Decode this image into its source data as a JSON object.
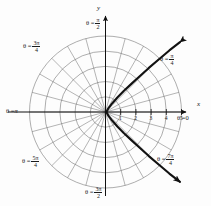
{
  "figure": {
    "type": "polar-plot",
    "axes": {
      "x_label": "x",
      "y_label": "y"
    },
    "theta_labels": [
      {
        "key": "theta_0",
        "text": "θ = 0",
        "prefix": "θ =",
        "num": "",
        "den": "",
        "plain": "0",
        "angle_deg": 0
      },
      {
        "key": "theta_pi4",
        "text": "θ = π/4",
        "prefix": "θ =",
        "num": "π",
        "den": "4",
        "plain": "",
        "angle_deg": 45
      },
      {
        "key": "theta_pi2",
        "text": "θ = π/2",
        "prefix": "θ =",
        "num": "π",
        "den": "2",
        "plain": "",
        "angle_deg": 90
      },
      {
        "key": "theta_3pi4",
        "text": "θ = 3π/4",
        "prefix": "θ =",
        "num": "3π",
        "den": "4",
        "plain": "",
        "angle_deg": 135
      },
      {
        "key": "theta_pi",
        "text": "θ = π",
        "prefix": "θ =",
        "num": "",
        "den": "",
        "plain": "π",
        "angle_deg": 180
      },
      {
        "key": "theta_5pi4",
        "text": "θ = 5π/4",
        "prefix": "θ =",
        "num": "5π",
        "den": "4",
        "plain": "",
        "angle_deg": 225
      },
      {
        "key": "theta_3pi2",
        "text": "θ = 3π/2",
        "prefix": "θ =",
        "num": "3π",
        "den": "2",
        "plain": "",
        "angle_deg": 270
      },
      {
        "key": "theta_7pi4",
        "text": "θ = 7π/4",
        "prefix": "θ =",
        "num": "7π",
        "den": "4",
        "plain": "",
        "angle_deg": 315
      }
    ],
    "x_ticks": [
      "1",
      "2",
      "3",
      "4",
      "5"
    ]
  },
  "chart_data": {
    "type": "line",
    "title": "",
    "xlabel": "x",
    "ylabel": "y",
    "coordinate_system": "polar",
    "grid": true,
    "grid_circles_r": [
      1,
      2,
      3,
      4,
      5
    ],
    "grid_radial_step_deg": 15,
    "rlim": [
      0,
      5
    ],
    "xlim": [
      -5,
      5
    ],
    "ylim": [
      -5,
      5
    ],
    "x_tick_labels": [
      "1",
      "2",
      "3",
      "4",
      "5"
    ],
    "theta_tick_labels": [
      "θ = 0",
      "θ = π/4",
      "θ = π/2",
      "θ = 3π/4",
      "θ = π",
      "θ = 5π/4",
      "θ = 3π/2",
      "θ = 7π/4"
    ],
    "legend": [],
    "annotations": [],
    "series": [
      {
        "name": "polar curve",
        "style": "solid",
        "color": "#121212",
        "arrow_start": true,
        "arrow_end": true,
        "points_xy": [
          [
            4.9,
            4.6
          ],
          [
            4.2,
            4.05
          ],
          [
            3.5,
            3.45
          ],
          [
            2.85,
            2.9
          ],
          [
            2.25,
            2.35
          ],
          [
            1.7,
            1.85
          ],
          [
            1.2,
            1.38
          ],
          [
            0.78,
            0.95
          ],
          [
            0.45,
            0.58
          ],
          [
            0.2,
            0.26
          ],
          [
            0.06,
            0.0
          ],
          [
            0.2,
            -0.26
          ],
          [
            0.45,
            -0.58
          ],
          [
            0.78,
            -0.95
          ],
          [
            1.2,
            -1.38
          ],
          [
            1.7,
            -1.85
          ],
          [
            2.25,
            -2.35
          ],
          [
            2.85,
            -2.9
          ],
          [
            3.5,
            -3.45
          ],
          [
            4.2,
            -4.05
          ],
          [
            4.9,
            -4.6
          ]
        ]
      }
    ]
  }
}
